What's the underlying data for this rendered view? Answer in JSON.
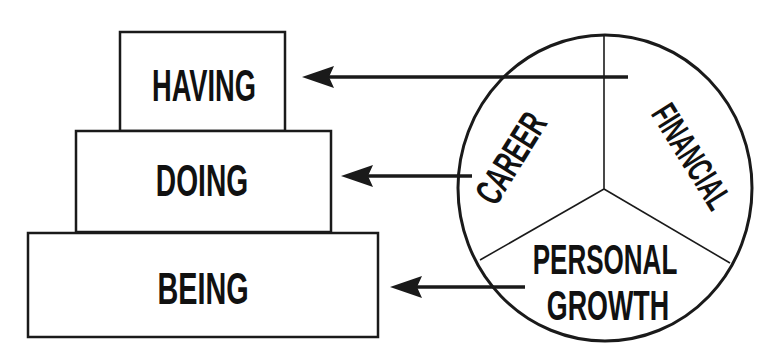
{
  "colors": {
    "ink": "#1a1a1a",
    "background": "#ffffff"
  },
  "pyramid": {
    "levels": [
      {
        "id": "having",
        "label": "HAVING"
      },
      {
        "id": "doing",
        "label": "DOING"
      },
      {
        "id": "being",
        "label": "BEING"
      }
    ]
  },
  "wheel": {
    "segments": [
      {
        "id": "career",
        "label": "CAREER",
        "points_to": "DOING"
      },
      {
        "id": "financial",
        "label": "FINANCIAL",
        "points_to": "HAVING"
      },
      {
        "id": "personal-growth",
        "label_line1": "PERSONAL",
        "label_line2": "GROWTH",
        "points_to": "BEING"
      }
    ]
  },
  "arrows": [
    {
      "from": "FINANCIAL",
      "to": "HAVING",
      "icon": "arrow-left-icon"
    },
    {
      "from": "CAREER",
      "to": "DOING",
      "icon": "arrow-left-icon"
    },
    {
      "from": "PERSONAL GROWTH",
      "to": "BEING",
      "icon": "arrow-left-icon"
    }
  ]
}
